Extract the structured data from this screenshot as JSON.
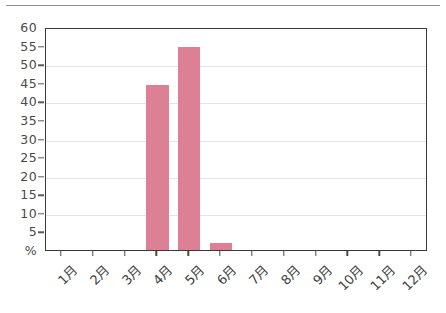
{
  "chart_data": {
    "type": "bar",
    "title": "",
    "subtitle": "",
    "xlabel": "",
    "ylabel": "%",
    "categories": [
      "1月",
      "2月",
      "3月",
      "4月",
      "5月",
      "6月",
      "7月",
      "8月",
      "9月",
      "10月",
      "11月",
      "12月"
    ],
    "values": [
      0,
      0,
      0,
      44.3,
      54.5,
      2.0,
      0,
      0,
      0,
      0,
      0,
      0
    ],
    "ylim": [
      0,
      60
    ],
    "ytick_values": [
      0,
      5,
      10,
      15,
      20,
      25,
      30,
      35,
      40,
      45,
      50,
      55,
      60
    ],
    "ytick_labels": [
      "%",
      "5",
      "10",
      "15",
      "20",
      "25",
      "30",
      "35",
      "40",
      "45",
      "50",
      "55",
      "60"
    ],
    "gridlines": [
      10,
      20,
      30,
      40,
      50
    ],
    "grid": true,
    "legend": false,
    "legend_position": "none",
    "bar_color": "#dd8096",
    "axis_color": "#3a3a3a",
    "grid_color": "#e3e3e3",
    "series": [
      {
        "name": "",
        "values": [
          0,
          0,
          0,
          44.3,
          54.5,
          2.0,
          0,
          0,
          0,
          0,
          0,
          0
        ]
      }
    ]
  },
  "figure": {
    "background_color": "#ffffff",
    "rule_color": "#8f8f8f"
  }
}
